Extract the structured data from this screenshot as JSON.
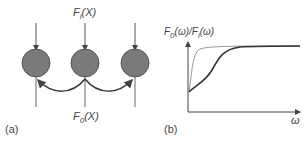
{
  "panel_a": {
    "label": "(a)",
    "input_symbol": "F",
    "input_sub": "i",
    "input_arg": "(X)",
    "output_symbol": "F",
    "output_sub": "0",
    "output_arg": "(X)",
    "node_count": 3
  },
  "panel_b": {
    "label": "(b)",
    "y_label_num": "F",
    "y_label_num_sub": "0",
    "y_label_num_arg": "(ω)",
    "y_label_sep": "/",
    "y_label_den": "F",
    "y_label_den_sub": "i",
    "y_label_den_arg": "(ω)",
    "x_label": "ω"
  },
  "colors": {
    "node_fill": "#7a7a7a",
    "line": "#555555",
    "thin_curve": "#888888",
    "thick_curve": "#333333"
  }
}
